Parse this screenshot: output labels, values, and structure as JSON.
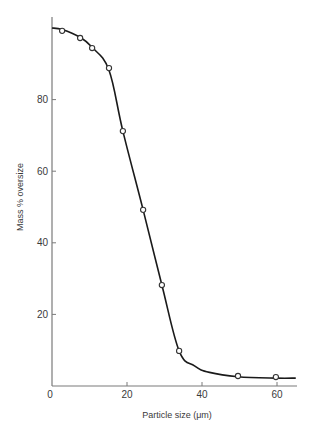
{
  "chart_data": {
    "type": "line",
    "title": "",
    "xlabel": "Particle size (μm)",
    "ylabel": "Mass % oversize",
    "xlim": [
      0,
      65
    ],
    "ylim": [
      0,
      102
    ],
    "grid": false,
    "legend": null,
    "x_ticks": [
      0,
      20,
      40,
      60
    ],
    "y_ticks": [
      20,
      40,
      60,
      80
    ],
    "x_tick_labels": [
      "0",
      "20",
      "40",
      "60"
    ],
    "y_tick_labels": [
      "20",
      "40",
      "60",
      "80"
    ],
    "series": [
      {
        "name": "measured",
        "marker": "open-circle",
        "x": [
          2.7,
          7.5,
          10.7,
          15.2,
          18.9,
          24.3,
          29.3,
          33.9,
          49.6,
          59.7
        ],
        "y": [
          99.2,
          97.2,
          94.4,
          88.8,
          71.2,
          49.2,
          28.2,
          9.8,
          2.8,
          2.5
        ]
      },
      {
        "name": "fitted curve",
        "marker": "none",
        "x": [
          0,
          2.7,
          7.5,
          10.7,
          15.2,
          18.9,
          24.3,
          29.3,
          33.9,
          38,
          42,
          49.6,
          59.7,
          65
        ],
        "y": [
          100,
          99.6,
          97.4,
          94.6,
          88.2,
          71.2,
          49.2,
          28.2,
          9.8,
          5.6,
          3.8,
          2.6,
          2.2,
          2.2
        ]
      }
    ]
  },
  "colors": {
    "axis": "#7a7a7a",
    "curve": "#1a1a1a",
    "marker_fill": "#ffffff",
    "marker_stroke": "#333333",
    "text": "#3a3a3a"
  }
}
